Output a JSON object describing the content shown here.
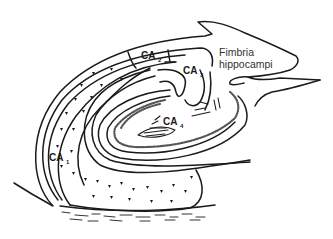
{
  "diagram": {
    "labels": {
      "ca1": {
        "main": "CA",
        "sub": "1"
      },
      "ca2": {
        "main": "CA",
        "sub": "2"
      },
      "ca3": {
        "main": "CA",
        "sub": "3"
      },
      "ca4": {
        "main": "CA",
        "sub": "4"
      },
      "fimbria_line1": "Fimbria",
      "fimbria_line2": "hippocampi"
    },
    "colors": {
      "line": "#1a1a1a",
      "background": "#ffffff"
    }
  }
}
